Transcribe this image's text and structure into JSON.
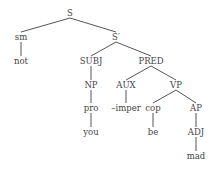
{
  "diagram": {
    "type": "syntax-tree",
    "nodes": {
      "S": {
        "label": "S",
        "x": 70,
        "y": 13
      },
      "sm": {
        "label": "sm",
        "x": 21,
        "y": 37
      },
      "not": {
        "label": "not",
        "x": 21,
        "y": 61
      },
      "Sbar": {
        "label": "S′",
        "x": 116,
        "y": 37
      },
      "SUBJ": {
        "label": "SUBJ",
        "x": 91,
        "y": 61
      },
      "NP": {
        "label": "NP",
        "x": 91,
        "y": 85
      },
      "pro": {
        "label": "pro",
        "x": 91,
        "y": 108
      },
      "you": {
        "label": "you",
        "x": 91,
        "y": 132
      },
      "PRED": {
        "label": "PRED",
        "x": 151,
        "y": 61
      },
      "AUX": {
        "label": "AUX",
        "x": 126,
        "y": 85
      },
      "imper": {
        "label": "–imper",
        "x": 126,
        "y": 108
      },
      "VP": {
        "label": "VP",
        "x": 176,
        "y": 85
      },
      "cop": {
        "label": "cop",
        "x": 153,
        "y": 108
      },
      "be": {
        "label": "be",
        "x": 153,
        "y": 132
      },
      "AP": {
        "label": "AP",
        "x": 196,
        "y": 108
      },
      "ADJ": {
        "label": "ADJ",
        "x": 196,
        "y": 132
      },
      "mad": {
        "label": "mad",
        "x": 196,
        "y": 156
      }
    },
    "edges": [
      [
        "S",
        "sm"
      ],
      [
        "S",
        "Sbar"
      ],
      [
        "sm",
        "not"
      ],
      [
        "Sbar",
        "SUBJ"
      ],
      [
        "Sbar",
        "PRED"
      ],
      [
        "SUBJ",
        "NP"
      ],
      [
        "NP",
        "pro"
      ],
      [
        "pro",
        "you"
      ],
      [
        "PRED",
        "AUX"
      ],
      [
        "PRED",
        "VP"
      ],
      [
        "AUX",
        "imper"
      ],
      [
        "VP",
        "cop"
      ],
      [
        "VP",
        "AP"
      ],
      [
        "cop",
        "be"
      ],
      [
        "AP",
        "ADJ"
      ],
      [
        "ADJ",
        "mad"
      ]
    ]
  }
}
